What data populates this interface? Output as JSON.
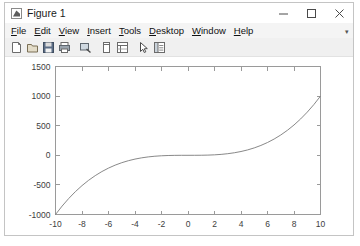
{
  "window": {
    "title": "Figure 1",
    "icon": "matlab-figure-icon",
    "controls": [
      {
        "name": "minimize-button",
        "glyph": "minimize-icon"
      },
      {
        "name": "maximize-button",
        "glyph": "maximize-icon"
      },
      {
        "name": "close-button",
        "glyph": "close-icon"
      }
    ]
  },
  "menu": {
    "items": [
      {
        "label": "File",
        "mnemonic": "F"
      },
      {
        "label": "Edit",
        "mnemonic": "E"
      },
      {
        "label": "View",
        "mnemonic": "V"
      },
      {
        "label": "Insert",
        "mnemonic": "I"
      },
      {
        "label": "Tools",
        "mnemonic": "T"
      },
      {
        "label": "Desktop",
        "mnemonic": "D"
      },
      {
        "label": "Window",
        "mnemonic": "W"
      },
      {
        "label": "Help",
        "mnemonic": "H"
      }
    ],
    "overflow_marker": "▾"
  },
  "toolbar": {
    "buttons": [
      {
        "name": "new-figure-icon",
        "tooltip": "New Figure"
      },
      {
        "name": "open-file-icon",
        "tooltip": "Open File"
      },
      {
        "name": "save-figure-icon",
        "tooltip": "Save Figure"
      },
      {
        "name": "print-figure-icon",
        "tooltip": "Print Figure"
      },
      {
        "name": "zoom-region-icon",
        "tooltip": "Zoom"
      },
      {
        "name": "data-cursor-icon",
        "tooltip": "Data Cursor"
      },
      {
        "name": "insert-legend-icon",
        "tooltip": "Insert Legend"
      },
      {
        "name": "edit-plot-arrow-icon",
        "tooltip": "Edit Plot"
      },
      {
        "name": "show-plot-tools-icon",
        "tooltip": "Show Plot Tools"
      }
    ]
  },
  "colors": {
    "window_background": "#f0f0f0",
    "title_background": "#ffffff",
    "menu_background": "#f4f4f4",
    "axes_background": "#ffffff",
    "axes_border": "#9a9a9a",
    "curve": "#7a7a7a",
    "tick_label": "#3d3d3d"
  },
  "chart_data": {
    "type": "line",
    "title": "",
    "xlabel": "",
    "ylabel": "",
    "xlim": [
      -10,
      10
    ],
    "ylim": [
      -1000,
      1500
    ],
    "xticks": [
      -10,
      -8,
      -6,
      -4,
      -2,
      0,
      2,
      4,
      6,
      8,
      10
    ],
    "xtick_labels": [
      "-10",
      "-8",
      "-6",
      "-4",
      "-2",
      "0",
      "2",
      "4",
      "6",
      "8",
      "10"
    ],
    "yticks": [
      -1000,
      -500,
      0,
      500,
      1000,
      1500
    ],
    "ytick_labels": [
      "-1000",
      "-500",
      "0",
      "500",
      "1000",
      "1500"
    ],
    "grid": false,
    "legend": null,
    "box": true,
    "series": [
      {
        "name": "y = x^3",
        "color": "#7a7a7a",
        "x": [
          -10,
          -9.5,
          -9,
          -8.5,
          -8,
          -7.5,
          -7,
          -6.5,
          -6,
          -5.5,
          -5,
          -4.5,
          -4,
          -3.5,
          -3,
          -2.5,
          -2,
          -1.5,
          -1,
          -0.5,
          0,
          0.5,
          1,
          1.5,
          2,
          2.5,
          3,
          3.5,
          4,
          4.5,
          5,
          5.5,
          6,
          6.5,
          7,
          7.5,
          8,
          8.5,
          9,
          9.5,
          10
        ],
        "y": [
          -1000,
          -857.4,
          -729,
          -614.1,
          -512,
          -421.9,
          -343,
          -274.6,
          -216,
          -166.4,
          -125,
          -91.1,
          -64,
          -42.9,
          -27,
          -15.6,
          -8,
          -3.4,
          -1,
          -0.1,
          0,
          0.1,
          1,
          3.4,
          8,
          15.6,
          27,
          42.9,
          64,
          91.1,
          125,
          166.4,
          216,
          274.6,
          343,
          421.9,
          512,
          614.1,
          729,
          857.4,
          1000
        ]
      }
    ]
  }
}
